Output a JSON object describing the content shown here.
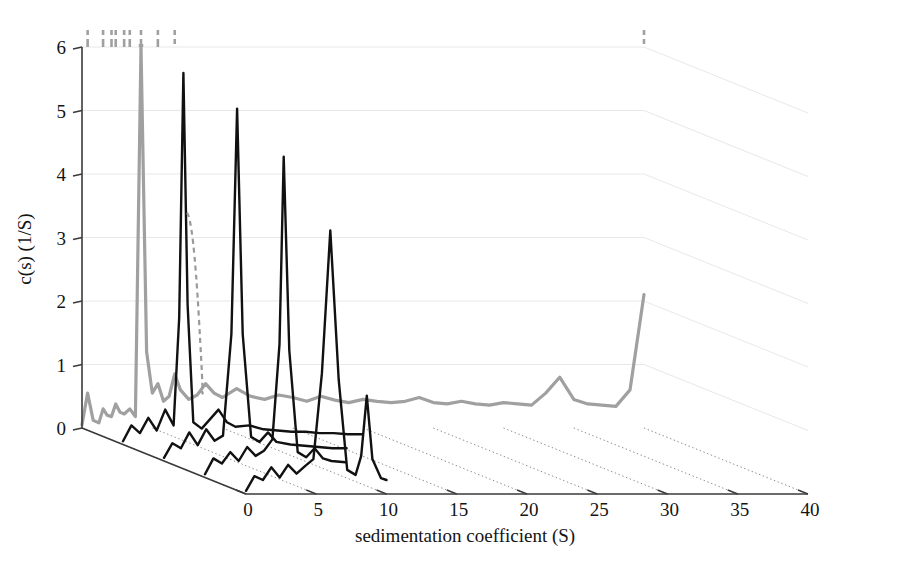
{
  "figure": {
    "type": "3d-waterfall-plot",
    "background": "#ffffff",
    "black_color": "#111111",
    "grey_color": "#a0a0a0",
    "grid_color": "#e8e8e8",
    "axis_color": "#3a3a3a"
  },
  "axes": {
    "y": {
      "label": "c(s) (1/S)",
      "ticks": [
        "6",
        "5",
        "4",
        "3",
        "2",
        "1",
        "0"
      ],
      "tick_values": [
        6,
        5,
        4,
        3,
        2,
        1,
        0
      ],
      "min": 0,
      "max": 6
    },
    "x": {
      "label": "sedimentation coefficient (S)",
      "ticks": [
        "0",
        "5",
        "10",
        "15",
        "20",
        "25",
        "30",
        "35",
        "40"
      ],
      "tick_values": [
        0,
        5,
        10,
        15,
        20,
        25,
        30,
        35,
        40
      ],
      "min": 0,
      "max": 40
    }
  },
  "chart_data": {
    "type": "line",
    "title": "",
    "xlabel": "sedimentation coefficient (S)",
    "ylabel": "c(s) (1/S)",
    "xlim": [
      0,
      40
    ],
    "ylim": [
      0,
      6
    ],
    "grid": true,
    "legend": "none",
    "projection": "3d-waterfall",
    "series": [
      {
        "name": "trace-1-grey-back",
        "color": "#a0a0a0",
        "style": "solid",
        "depth_index": 0,
        "x": [
          0.0,
          0.4,
          0.8,
          1.2,
          1.5,
          1.8,
          2.1,
          2.4,
          2.7,
          3.0,
          3.4,
          3.8,
          4.2,
          4.6,
          5.0,
          5.4,
          5.8,
          6.2,
          6.6,
          7.0,
          7.6,
          8.2,
          8.8,
          9.4,
          10.0,
          11.0,
          12.0,
          13.0,
          14.0,
          15.0,
          16.0,
          17.0,
          18.0,
          19.0,
          20.0,
          21.0,
          22.0,
          23.0,
          24.0,
          25.0,
          26.0,
          27.0,
          28.0,
          29.0,
          30.0,
          31.0,
          32.0,
          33.0,
          34.0,
          35.0,
          36.0,
          37.0,
          38.0,
          39.0,
          40.0
        ],
        "y": [
          0.05,
          0.55,
          0.12,
          0.08,
          0.3,
          0.2,
          0.18,
          0.38,
          0.25,
          0.22,
          0.3,
          0.18,
          6.0,
          1.2,
          0.55,
          0.7,
          0.42,
          0.5,
          0.85,
          0.6,
          0.45,
          0.52,
          0.7,
          0.55,
          0.48,
          0.62,
          0.5,
          0.45,
          0.52,
          0.48,
          0.42,
          0.5,
          0.44,
          0.4,
          0.45,
          0.42,
          0.4,
          0.42,
          0.48,
          0.4,
          0.38,
          0.42,
          0.38,
          0.36,
          0.4,
          0.38,
          0.36,
          0.55,
          0.8,
          0.45,
          0.38,
          0.36,
          0.34,
          0.6,
          2.1
        ],
        "note": "Grey curve lies furthest back; its tall peaks are clipped at the top of the axis and drawn dashed above the box."
      },
      {
        "name": "trace-2-black",
        "color": "#111111",
        "style": "solid",
        "depth_index": 1,
        "peak_s": 4.3,
        "peak_height": 5.85,
        "x": [
          0.0,
          0.6,
          1.2,
          1.8,
          2.4,
          3.0,
          3.6,
          4.0,
          4.3,
          4.6,
          5.0,
          5.6,
          6.2,
          6.8,
          7.4,
          8.0,
          9.0,
          10.0,
          11.0,
          12.0,
          13.0,
          14.0,
          15.0,
          16.0,
          17.0
        ],
        "y": [
          0.05,
          0.3,
          0.18,
          0.42,
          0.22,
          0.55,
          0.3,
          2.0,
          5.85,
          2.2,
          0.35,
          0.25,
          0.4,
          0.55,
          0.35,
          0.28,
          0.3,
          0.24,
          0.22,
          0.2,
          0.2,
          0.18,
          0.18,
          0.16,
          0.16
        ]
      },
      {
        "name": "trace-3-black",
        "color": "#111111",
        "style": "solid",
        "depth_index": 2,
        "peak_s": 5.2,
        "peak_height": 5.55,
        "x": [
          0.0,
          0.6,
          1.2,
          1.8,
          2.4,
          3.0,
          3.6,
          4.2,
          4.8,
          5.2,
          5.6,
          6.2,
          6.8,
          7.4,
          8.0,
          9.0,
          10.0,
          11.0,
          12.0,
          13.0
        ],
        "y": [
          0.05,
          0.28,
          0.2,
          0.45,
          0.25,
          0.5,
          0.32,
          0.4,
          2.0,
          5.55,
          2.0,
          0.38,
          0.3,
          0.45,
          0.3,
          0.26,
          0.24,
          0.22,
          0.2,
          0.2
        ]
      },
      {
        "name": "trace-4-black",
        "color": "#111111",
        "style": "solid",
        "depth_index": 3,
        "peak_s": 5.6,
        "peak_height": 5.05,
        "x": [
          0.0,
          0.6,
          1.2,
          1.8,
          2.4,
          3.0,
          3.6,
          4.2,
          4.8,
          5.3,
          5.6,
          6.0,
          6.6,
          7.2,
          7.8,
          8.4,
          9.0,
          10.0
        ],
        "y": [
          0.05,
          0.3,
          0.22,
          0.4,
          0.26,
          0.48,
          0.34,
          0.42,
          0.6,
          2.1,
          5.05,
          2.0,
          0.4,
          0.32,
          0.46,
          0.3,
          0.26,
          0.24
        ]
      },
      {
        "name": "trace-5-black-front",
        "color": "#111111",
        "style": "solid",
        "depth_index": 4,
        "peak_s": 6.0,
        "peak_height": 4.15,
        "secondary_peak_s": 8.6,
        "secondary_peak_height": 1.55,
        "x": [
          0.0,
          0.6,
          1.2,
          1.8,
          2.4,
          3.0,
          3.6,
          4.2,
          4.8,
          5.4,
          6.0,
          6.6,
          7.2,
          7.8,
          8.2,
          8.6,
          9.0,
          9.6,
          10.0
        ],
        "y": [
          0.05,
          0.28,
          0.22,
          0.42,
          0.26,
          0.46,
          0.32,
          0.44,
          0.55,
          1.9,
          4.15,
          1.8,
          0.38,
          0.3,
          0.6,
          1.55,
          0.55,
          0.25,
          0.22
        ]
      }
    ]
  }
}
